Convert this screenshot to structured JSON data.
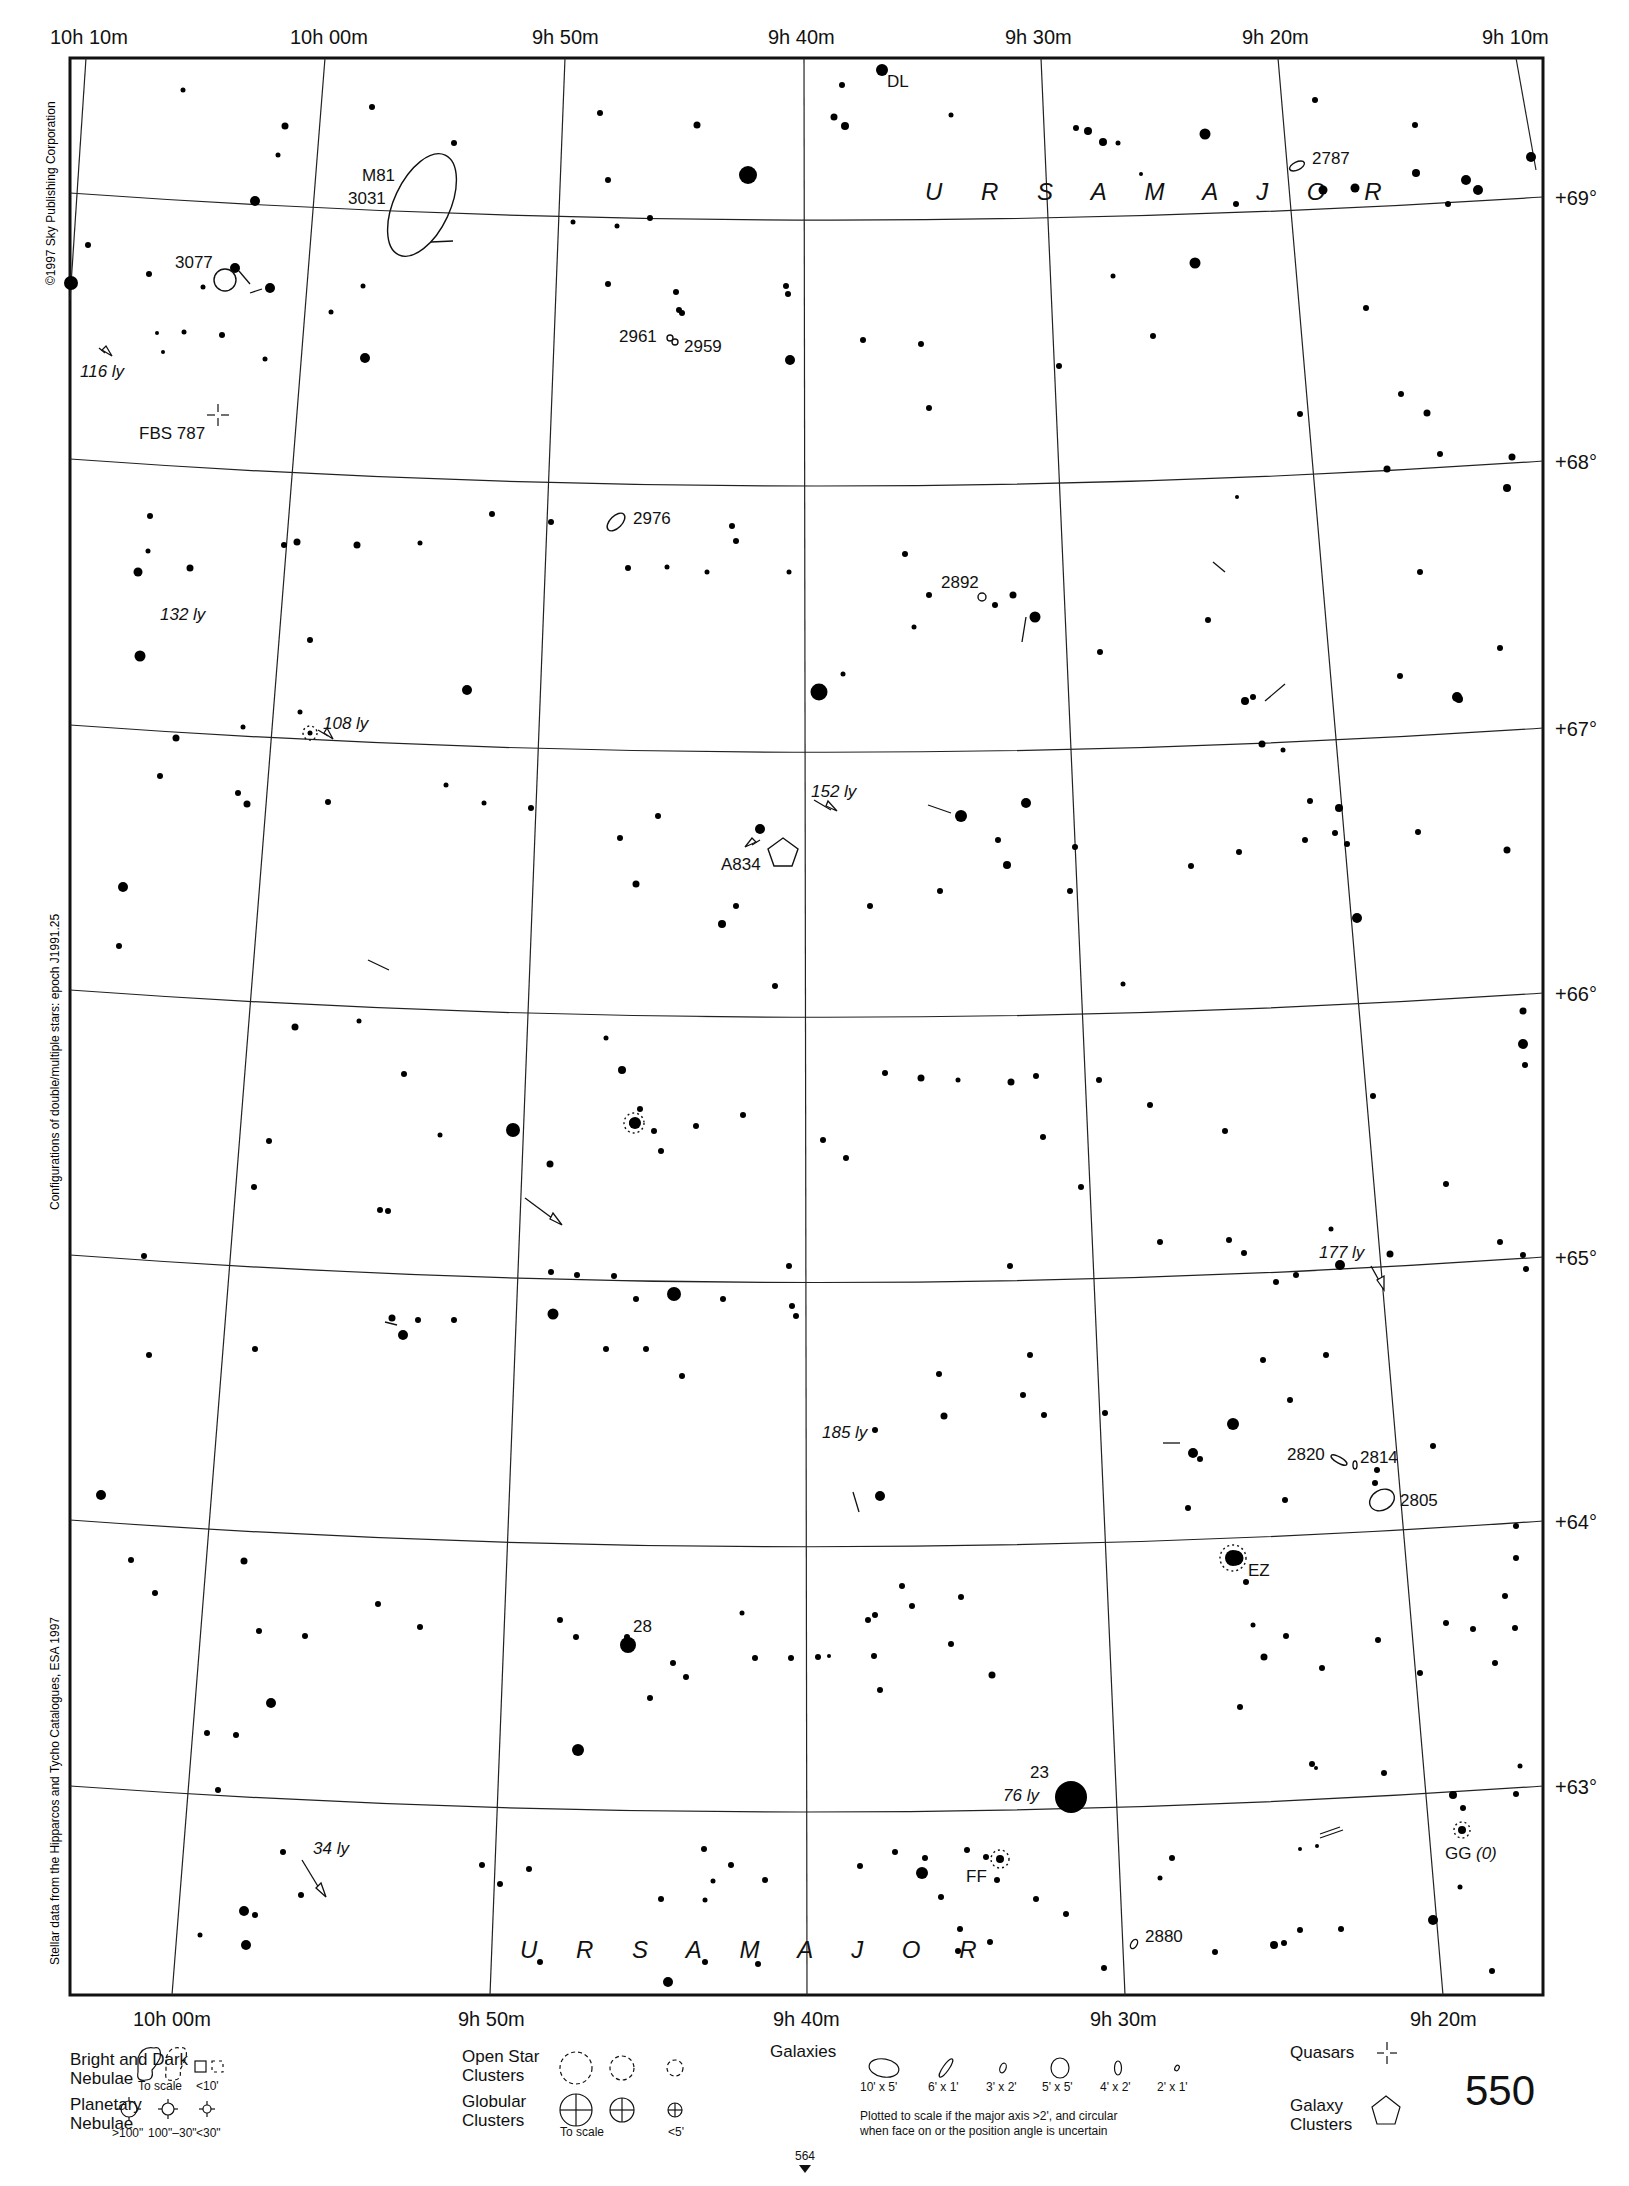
{
  "chart": {
    "page_number": "550",
    "constellation_labels": [
      "U R S A   M A J O R",
      "U R S A   M A J O R"
    ],
    "ra_top": [
      "10h 10m",
      "10h 00m",
      "9h 50m",
      "9h 40m",
      "9h 30m",
      "9h 20m",
      "9h 10m"
    ],
    "ra_bottom": [
      "10h 00m",
      "9h 50m",
      "9h 40m",
      "9h 30m",
      "9h 20m"
    ],
    "dec": [
      "+69°",
      "+68°",
      "+67°",
      "+66°",
      "+65°",
      "+64°",
      "+63°"
    ],
    "side_text": {
      "copyright": "©1997 Sky Publishing Corporation",
      "configurations": "Configurations of double/multiple stars: epoch J1991.25",
      "stellar_data": "Stellar data from the Hipparcos and Tycho Catalogues, ESA 1997"
    },
    "adjacent_chart": "564"
  },
  "objects": {
    "m81": "M81",
    "ngc3031": "3031",
    "ngc3077": "3077",
    "ngc2787": "2787",
    "ngc2961": "2961",
    "ngc2959": "2959",
    "fbs787": "FBS 787",
    "ngc2976": "2976",
    "ngc2892": "2892",
    "a834": "A834",
    "ngc2820": "2820",
    "ngc2814": "2814",
    "ngc2805": "2805",
    "ngc2880": "2880",
    "dl": "DL",
    "ez": "EZ",
    "ff": "FF",
    "gg": "GG",
    "gg_note": "(0)",
    "star28": "28",
    "star23": "23"
  },
  "distances": {
    "d116": "116 ly",
    "d132": "132 ly",
    "d108": "108 ly",
    "d152": "152 ly",
    "d177": "177 ly",
    "d185": "185 ly",
    "d76": "76 ly",
    "d34": "34 ly"
  },
  "legend": {
    "nebulae_title_1": "Bright and Dark",
    "nebulae_title_2": "Nebulae",
    "nebulae_to_scale": "To scale",
    "nebulae_small": "<10'",
    "planetary_title_1": "Planetary",
    "planetary_title_2": "Nebulae",
    "planetary_sizes": [
      ">100\"",
      "100\"–30\"",
      "<30\""
    ],
    "open_title_1": "Open Star",
    "open_title_2": "Clusters",
    "globular_title_1": "Globular",
    "globular_title_2": "Clusters",
    "globular_to_scale": "To scale",
    "globular_small": "<5'",
    "galaxies_title": "Galaxies",
    "galaxy_sizes": [
      "10' x 5'",
      "6' x 1'",
      "3' x 2'",
      "5' x 5'",
      "4' x 2'",
      "2' x 1'"
    ],
    "galaxy_note_1": "Plotted to scale if the major axis >2', and circular",
    "galaxy_note_2": "when face on or the position angle is uncertain",
    "quasars_title": "Quasars",
    "galaxy_clusters_title_1": "Galaxy",
    "galaxy_clusters_title_2": "Clusters"
  }
}
